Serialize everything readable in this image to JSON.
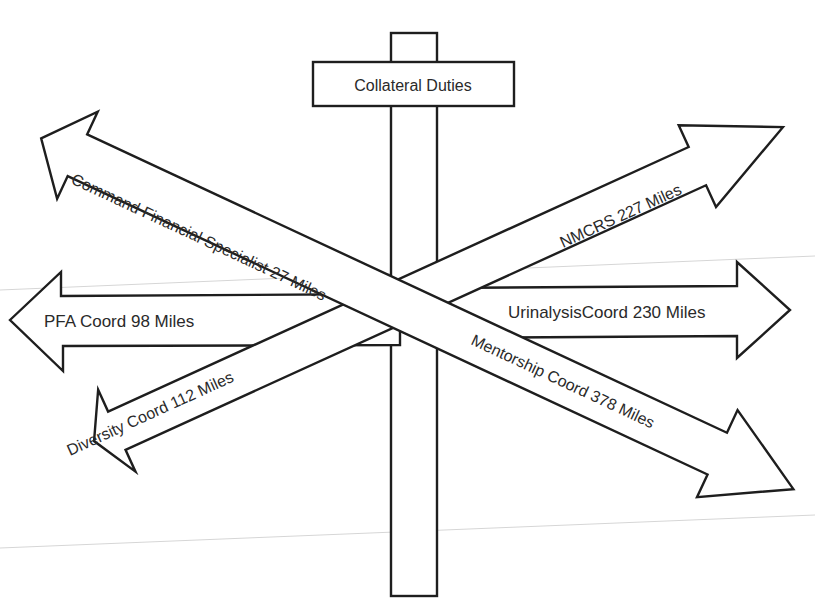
{
  "diagram": {
    "type": "signpost",
    "title": "Collateral Duties",
    "signs": [
      {
        "id": "cfs",
        "label": "Command Financial Specialist 27 Miles",
        "direction": "up-left"
      },
      {
        "id": "nmcrs",
        "label": "NMCRS 227 Miles",
        "direction": "up-right"
      },
      {
        "id": "pfa",
        "label": "PFA Coord 98 Miles",
        "direction": "left"
      },
      {
        "id": "urinalysis",
        "label": "UrinalysisCoord 230 Miles",
        "direction": "right"
      },
      {
        "id": "diversity",
        "label": "Diversity Coord 112 Miles",
        "direction": "down-left"
      },
      {
        "id": "mentorship",
        "label": "Mentorship Coord 378 Miles",
        "direction": "down-right"
      }
    ]
  },
  "colors": {
    "background": "#ffffff",
    "outline": "#1e1e1e",
    "text": "#2a2a2a",
    "guide_lines": "#d6d6d6"
  }
}
